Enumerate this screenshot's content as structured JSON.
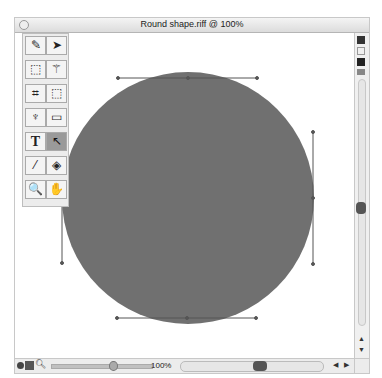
{
  "window": {
    "title": "Round shape.riff @ 100%"
  },
  "toolbox": {
    "tools": [
      {
        "name": "brush-tool",
        "glyph": "✎"
      },
      {
        "name": "move-tool",
        "glyph": "➤"
      },
      {
        "name": "marquee-tool",
        "glyph": "⬚"
      },
      {
        "name": "magic-wand-tool",
        "glyph": "⚚"
      },
      {
        "name": "crop-tool",
        "glyph": "⌗"
      },
      {
        "name": "selection-transform-tool",
        "glyph": "⬚"
      },
      {
        "name": "pen-tool",
        "glyph": "♆"
      },
      {
        "name": "rectangle-tool",
        "glyph": "▭"
      },
      {
        "name": "text-tool",
        "glyph": "T"
      },
      {
        "name": "direct-selection-tool",
        "glyph": "↖"
      },
      {
        "name": "eyedropper-tool",
        "glyph": "⁄"
      },
      {
        "name": "paint-bucket-tool",
        "glyph": "◈"
      },
      {
        "name": "zoom-tool",
        "glyph": "🔍"
      },
      {
        "name": "hand-tool",
        "glyph": "✋"
      }
    ],
    "active_tool": "direct-selection-tool"
  },
  "status_bar": {
    "zoom_level": "100%"
  },
  "canvas": {
    "shape": {
      "type": "circle",
      "fill": "#707070",
      "cx": 188,
      "cy": 198,
      "r": 126
    }
  },
  "colors": {
    "shape_fill": "#707070",
    "handle_line": "#555555"
  }
}
